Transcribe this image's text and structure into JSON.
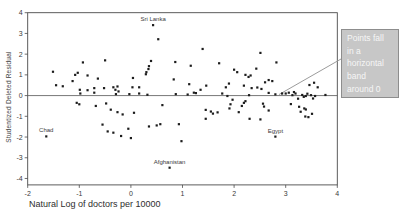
{
  "chart_data": {
    "type": "scatter",
    "title": "",
    "xlabel": "Natural Log of doctors per 10000",
    "ylabel": "Studentized Deleted Residual",
    "xlim": [
      -2,
      4
    ],
    "ylim": [
      -4.31,
      4
    ],
    "x_ticks": [
      "-2",
      "-1",
      "0",
      "1",
      "2",
      "3",
      "4"
    ],
    "y_ticks": [
      "4",
      "3",
      "2",
      "1",
      "0",
      "-1",
      "-2",
      "-3",
      "-4"
    ],
    "grid": false,
    "reference_line_y": 0,
    "marker_color": "#1c1c1c",
    "axis_color": "#4a4a4a",
    "tick_label_color": "#3a3a3a",
    "points": [
      [
        -1.51,
        1.15
      ],
      [
        -1.45,
        0.5
      ],
      [
        -1.32,
        0.45
      ],
      [
        -1.13,
        0.7
      ],
      [
        -1.08,
        1.0
      ],
      [
        -1.05,
        -0.35
      ],
      [
        -1.03,
        1.1
      ],
      [
        -1.0,
        -0.42
      ],
      [
        -0.99,
        0.28
      ],
      [
        -0.98,
        0.1
      ],
      [
        -0.93,
        1.6
      ],
      [
        -0.84,
        0.97
      ],
      [
        -0.84,
        0.26
      ],
      [
        -0.71,
        0.36
      ],
      [
        -0.71,
        0.14
      ],
      [
        -0.68,
        -0.5
      ],
      [
        -0.64,
        0.82
      ],
      [
        -0.55,
        -1.4
      ],
      [
        -0.52,
        0.36
      ],
      [
        -0.5,
        1.7
      ],
      [
        -0.48,
        -0.38
      ],
      [
        -0.45,
        -1.73
      ],
      [
        -0.39,
        -0.68
      ],
      [
        -0.34,
        0.4
      ],
      [
        -0.34,
        -1.79
      ],
      [
        -0.3,
        0.28
      ],
      [
        -0.29,
        0.07
      ],
      [
        -0.26,
        0.44
      ],
      [
        -0.26,
        -0.8
      ],
      [
        -0.24,
        0.2
      ],
      [
        -0.19,
        -1.95
      ],
      [
        -0.16,
        -0.91
      ],
      [
        -0.05,
        -1.6
      ],
      [
        -0.03,
        0.07
      ],
      [
        0.0,
        -2.05
      ],
      [
        0.03,
        0.4
      ],
      [
        0.04,
        0.85
      ],
      [
        0.06,
        -0.83
      ],
      [
        0.16,
        0.4
      ],
      [
        0.16,
        0.1
      ],
      [
        0.29,
        1.03
      ],
      [
        0.3,
        1.13
      ],
      [
        0.32,
        0.04
      ],
      [
        0.34,
        1.28
      ],
      [
        0.35,
        1.42
      ],
      [
        0.35,
        -1.49
      ],
      [
        0.39,
        1.67
      ],
      [
        0.5,
        -1.44
      ],
      [
        0.53,
        2.72
      ],
      [
        0.57,
        -1.38
      ],
      [
        0.61,
        -0.46
      ],
      [
        0.83,
        0.78
      ],
      [
        0.86,
        1.62
      ],
      [
        0.87,
        0.07
      ],
      [
        0.93,
        -1.38
      ],
      [
        0.98,
        -2.2
      ],
      [
        1.1,
        0.05
      ],
      [
        1.13,
        0.55
      ],
      [
        1.16,
        1.44
      ],
      [
        1.22,
        0.14
      ],
      [
        1.26,
        0.12
      ],
      [
        1.35,
        0.28
      ],
      [
        1.39,
        2.25
      ],
      [
        1.45,
        -1.12
      ],
      [
        1.45,
        -0.69
      ],
      [
        1.46,
        0.48
      ],
      [
        1.55,
        -0.77
      ],
      [
        1.59,
        -0.87
      ],
      [
        1.68,
        -0.81
      ],
      [
        1.71,
        1.56
      ],
      [
        1.77,
        0.1
      ],
      [
        1.84,
        0.4
      ],
      [
        1.87,
        -0.02
      ],
      [
        1.9,
        0.58
      ],
      [
        1.91,
        -0.62
      ],
      [
        1.93,
        -0.42
      ],
      [
        1.97,
        -0.2
      ],
      [
        2.0,
        1.25
      ],
      [
        2.06,
        1.13
      ],
      [
        2.09,
        -0.8
      ],
      [
        2.15,
        -0.5
      ],
      [
        2.19,
        0.48
      ],
      [
        2.19,
        -0.35
      ],
      [
        2.22,
        1.0
      ],
      [
        2.22,
        -0.27
      ],
      [
        2.28,
        0.9
      ],
      [
        2.29,
        0.02
      ],
      [
        2.3,
        -1.12
      ],
      [
        2.32,
        0.97
      ],
      [
        2.34,
        0.36
      ],
      [
        2.43,
        1.3
      ],
      [
        2.45,
        0.39
      ],
      [
        2.51,
        2.06
      ],
      [
        2.51,
        -1.15
      ],
      [
        2.53,
        0.32
      ],
      [
        2.56,
        -0.39
      ],
      [
        2.58,
        -0.53
      ],
      [
        2.6,
        0.64
      ],
      [
        2.67,
        0.75
      ],
      [
        2.67,
        0.13
      ],
      [
        2.67,
        -0.72
      ],
      [
        2.74,
        0.7
      ],
      [
        2.8,
        0.06
      ],
      [
        2.82,
        1.6
      ],
      [
        2.93,
        0.1
      ],
      [
        3.0,
        0.1
      ],
      [
        3.06,
        0.14
      ],
      [
        3.1,
        -0.41
      ],
      [
        3.13,
        0.02
      ],
      [
        3.16,
        0.17
      ],
      [
        3.19,
        0.1
      ],
      [
        3.24,
        -0.15
      ],
      [
        3.26,
        -0.54
      ],
      [
        3.29,
        -0.78
      ],
      [
        3.32,
        0.03
      ],
      [
        3.35,
        -0.06
      ],
      [
        3.36,
        -0.62
      ],
      [
        3.38,
        -1.01
      ],
      [
        3.39,
        -0.02
      ],
      [
        3.39,
        -0.67
      ],
      [
        3.42,
        0.09
      ],
      [
        3.44,
        -1.04
      ],
      [
        3.46,
        0.51
      ],
      [
        3.49,
        0.02
      ],
      [
        3.51,
        -0.88
      ],
      [
        3.53,
        -0.14
      ],
      [
        3.55,
        0.62
      ],
      [
        3.57,
        -0.02
      ],
      [
        3.62,
        0.4
      ],
      [
        3.77,
        0.03
      ]
    ],
    "labeled_points": [
      {
        "label": "Sri Lanka",
        "x": 0.43,
        "y": 3.4
      },
      {
        "label": "Chad",
        "x": -1.64,
        "y": -1.97
      },
      {
        "label": "Afghanistan",
        "x": 0.75,
        "y": -3.48
      },
      {
        "label": "Egypt",
        "x": 2.8,
        "y": -1.98
      }
    ],
    "point_label_color": "#3a3a3a"
  },
  "annotation": {
    "text": "Points fall\nin a\nhorizontal\nband\naround 0",
    "target": {
      "x": 2.87,
      "y": 0.05
    },
    "box_bg": "#c7c7c7",
    "box_border": "#8d8d8d",
    "text_color": "#f6f6f6",
    "leader_color": "#9c9c9c"
  }
}
